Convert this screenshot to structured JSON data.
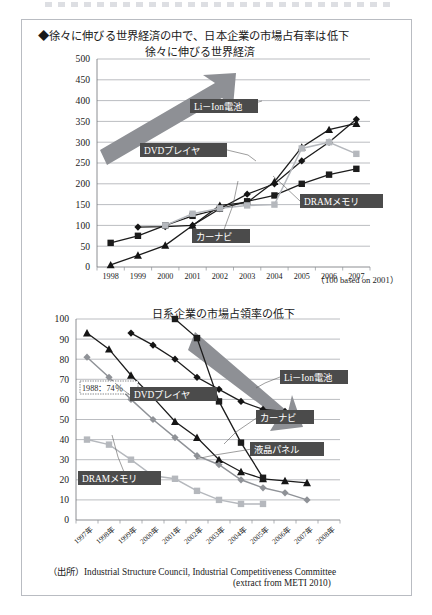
{
  "document": {
    "heading": "◆徐々に伸びる世界経済の中で、日本企業の市場占有率は低下",
    "source_line1": "（出所）Industrial Structure Council, Industrial Competitiveness Committee",
    "source_line2": "(extract from METI 2010)"
  },
  "chart_data": [
    {
      "type": "line",
      "title": "徐々に伸びる世界経済",
      "xlabel": "",
      "ylabel": "",
      "axis_note": "（100 based on 2001）",
      "ylim": [
        0,
        500
      ],
      "ytick_step": 50,
      "yticks": [
        0,
        50,
        100,
        150,
        200,
        250,
        300,
        350,
        400,
        450,
        500
      ],
      "categories": [
        "1998",
        "1999",
        "2000",
        "2001",
        "2002",
        "2003",
        "2004",
        "2005",
        "2006",
        "2007"
      ],
      "grid": true,
      "legend": "inline-callouts",
      "annotation_arrow": "upward growth arrow",
      "series": [
        {
          "name": "Li－Ion電池",
          "marker": "diamond",
          "color": "#1c1c1c",
          "values": [
            null,
            96,
            97,
            100,
            140,
            175,
            200,
            255,
            300,
            355,
            445
          ]
        },
        {
          "name": "DVDプレイヤ",
          "marker": "triangle",
          "color": "#1c1c1c",
          "values": [
            5,
            28,
            52,
            100,
            148,
            155,
            205,
            288,
            330,
            345,
            350
          ]
        },
        {
          "name": "DRAMメモリ",
          "marker": "square",
          "color": "#1c1c1c",
          "values": [
            58,
            75,
            100,
            123,
            140,
            158,
            172,
            200,
            222,
            236
          ]
        },
        {
          "name": "カーナビ",
          "marker": "square-gray",
          "color": "#b5b8bd",
          "values": [
            null,
            null,
            100,
            128,
            141,
            148,
            150,
            285,
            300,
            272
          ]
        }
      ]
    },
    {
      "type": "line",
      "title": "日系企業の市場占領率の低下",
      "xlabel": "",
      "ylabel": "",
      "ylim": [
        0,
        100
      ],
      "ytick_step": 10,
      "yticks": [
        0,
        10,
        20,
        30,
        40,
        50,
        60,
        70,
        80,
        90,
        100
      ],
      "categories": [
        "1997年",
        "1998年",
        "1999年",
        "2000年",
        "2001年",
        "2002年",
        "2003年",
        "2004年",
        "2005年",
        "2006年",
        "2007年",
        "2008年"
      ],
      "grid": true,
      "annotation": "1988：74％",
      "annotation_arrow": "downward decline arrow",
      "series": [
        {
          "name": "Li－Ion電池",
          "marker": "diamond",
          "color": "#1c1c1c",
          "values": [
            null,
            null,
            93,
            87,
            80,
            71,
            65,
            59,
            55,
            54,
            50.5,
            null
          ]
        },
        {
          "name": "DVDプレイヤ",
          "marker": "triangle",
          "color": "#1c1c1c",
          "values": [
            93,
            85,
            72,
            61,
            49,
            41,
            30,
            24,
            20.5,
            19.5,
            18.5,
            null
          ]
        },
        {
          "name": "カーナビ",
          "marker": "square",
          "color": "#1c1c1c",
          "values": [
            null,
            null,
            null,
            null,
            100,
            90.5,
            59,
            38.5,
            21,
            null,
            null,
            null
          ]
        },
        {
          "name": "液晶パネル",
          "marker": "diamond-gray",
          "color": "#8f9297",
          "values": [
            81,
            71,
            60,
            50,
            41,
            32,
            27.5,
            20,
            16,
            13.5,
            10,
            null
          ]
        },
        {
          "name": "DRAMメモリ",
          "marker": "square-gray",
          "color": "#b5b8bd",
          "values": [
            40,
            37.5,
            30,
            22,
            20.5,
            14.5,
            10,
            8,
            8,
            null,
            null,
            null
          ]
        }
      ]
    }
  ]
}
